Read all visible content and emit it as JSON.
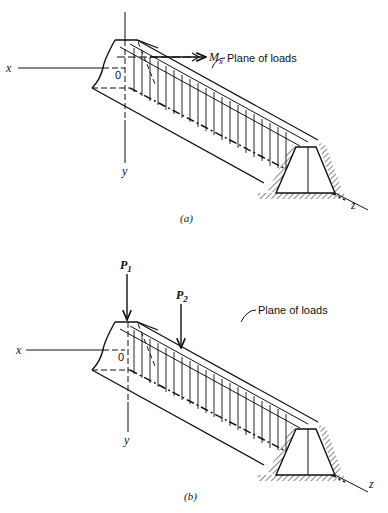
{
  "figure_a": {
    "caption": "(a)",
    "axis_x": "x",
    "axis_y": "y",
    "axis_z": "z",
    "origin": "0",
    "moment_label": "M",
    "moment_sub": "x",
    "plane_label": "Plane of loads"
  },
  "figure_b": {
    "caption": "(b)",
    "axis_x": "x",
    "axis_y": "y",
    "axis_z": "z",
    "origin": "0",
    "load1_label": "P",
    "load1_sub": "1",
    "load2_label": "P",
    "load2_sub": "2",
    "plane_label": "Plane of loads"
  },
  "colors": {
    "ink": "#111111",
    "background": "#ffffff"
  }
}
